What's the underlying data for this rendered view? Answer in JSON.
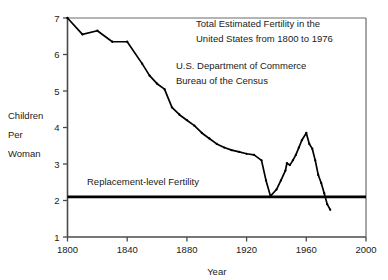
{
  "chart_data": {
    "type": "line",
    "title_lines": [
      "Total Estimated Fertility in the",
      "United States from 1800 to 1976"
    ],
    "source_lines": [
      "U.S. Department of Commerce",
      "Bureau of the Census"
    ],
    "xlabel": "Year",
    "ylabel": "Children Per Woman",
    "ylabel_lines": [
      "Children",
      "Per",
      "Woman"
    ],
    "xlim": [
      1800,
      2000
    ],
    "ylim": [
      1,
      7
    ],
    "xticks": [
      1800,
      1840,
      1880,
      1920,
      1960,
      2000
    ],
    "xtick_labels": [
      "1800",
      "1840",
      "1880",
      "1920",
      "1960",
      "2000"
    ],
    "yticks": [
      1,
      2,
      3,
      4,
      5,
      6,
      7
    ],
    "ytick_labels": [
      "1",
      "2",
      "3",
      "4",
      "5",
      "6",
      "7"
    ],
    "grid": false,
    "legend": "none",
    "line_color": "#000000",
    "annotations": [
      {
        "name": "replacement-level-line",
        "label": "Replacement-level Fertility",
        "value": 2.1,
        "kind": "hline",
        "color": "#000000"
      }
    ],
    "series": [
      {
        "name": "Total Estimated Fertility",
        "x": [
          1800,
          1810,
          1820,
          1830,
          1840,
          1850,
          1855,
          1860,
          1865,
          1870,
          1875,
          1880,
          1885,
          1890,
          1895,
          1900,
          1905,
          1910,
          1915,
          1920,
          1925,
          1930,
          1933,
          1936,
          1940,
          1943,
          1946,
          1947,
          1949,
          1951,
          1953,
          1955,
          1957,
          1960,
          1962,
          1964,
          1966,
          1968,
          1970,
          1972,
          1974,
          1976
        ],
        "y": [
          7.0,
          6.55,
          6.65,
          6.35,
          6.35,
          5.75,
          5.42,
          5.2,
          5.05,
          4.55,
          4.35,
          4.2,
          4.05,
          3.85,
          3.7,
          3.55,
          3.45,
          3.38,
          3.33,
          3.28,
          3.25,
          3.1,
          2.55,
          2.12,
          2.3,
          2.55,
          2.82,
          3.02,
          2.97,
          3.1,
          3.25,
          3.45,
          3.65,
          3.85,
          3.55,
          3.42,
          3.1,
          2.7,
          2.48,
          2.2,
          1.9,
          1.75
        ]
      }
    ]
  }
}
